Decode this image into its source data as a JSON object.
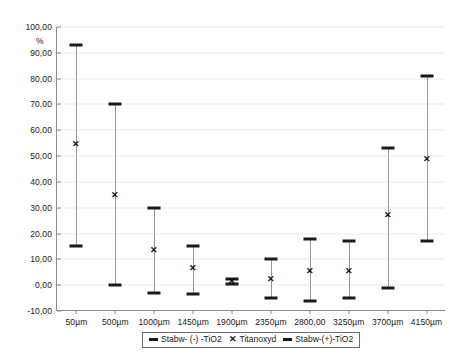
{
  "chart_data": {
    "type": "scatter",
    "title": "",
    "subtitle": "",
    "xlabel": "",
    "ylabel": "%",
    "ylim": [
      -10,
      100
    ],
    "ytick_step": 10,
    "grid": "horizontal-dotted",
    "legend_position": "bottom-center",
    "categories": [
      "50µm",
      "500µm",
      "1000µm",
      "1450µm",
      "1900µm",
      "2350µm",
      "2800,00",
      "3250µm",
      "3700µm",
      "4150µm"
    ],
    "ytick_labels": [
      "100,00",
      "90,00",
      "80,00",
      "70,00",
      "60,00",
      "50,00",
      "40,00",
      "30,00",
      "20,00",
      "10,00",
      "0,00",
      "-10,00"
    ],
    "ytick_values": [
      100,
      90,
      80,
      70,
      60,
      50,
      40,
      30,
      20,
      10,
      0,
      -10
    ],
    "series": [
      {
        "name": "Stabw- (-) -TiO2",
        "marker": "dash",
        "values": [
          15.0,
          0.0,
          -3.0,
          -3.5,
          0.5,
          -5.0,
          -6.0,
          -5.0,
          -1.0,
          17.0
        ]
      },
      {
        "name": "Titanoxyd",
        "marker": "x",
        "values": [
          54.5,
          35.0,
          13.5,
          6.5,
          1.5,
          2.5,
          5.5,
          5.5,
          27.0,
          49.0
        ]
      },
      {
        "name": "Stabw-(+)-TiO2",
        "marker": "dash",
        "values": [
          93.0,
          70.0,
          30.0,
          15.0,
          2.5,
          10.0,
          18.0,
          17.0,
          53.0,
          81.0
        ]
      }
    ]
  },
  "legend": {
    "entries": [
      {
        "label": "Stabw- (-) -TiO2",
        "glyph": "dash-icon"
      },
      {
        "label": "Titanoxyd",
        "glyph": "x-icon"
      },
      {
        "label": "Stabw-(+)-TiO2",
        "glyph": "dash-icon"
      }
    ]
  },
  "colors": {
    "axis": "#8c8c8c",
    "grid": "#d8d8d8",
    "marker": "#1a1a1a",
    "whisker": "#9a9a9a",
    "background": "#ffffff"
  }
}
